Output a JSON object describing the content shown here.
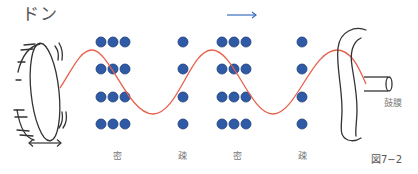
{
  "title_sound": "ドン",
  "labels": {
    "eardrum": "鼓膜",
    "caption": "図7−2",
    "regions": [
      {
        "text": "密",
        "x": 113
      },
      {
        "text": "疎",
        "x": 178
      },
      {
        "text": "密",
        "x": 233
      },
      {
        "text": "疎",
        "x": 298
      }
    ]
  },
  "colors": {
    "dot_fill": "#2f5aa6",
    "dot_stroke": "#1f3f7a",
    "wave": "#e8604c",
    "arrow": "#3a6fc4",
    "line": "#333333"
  },
  "particles": {
    "rows_y": [
      42,
      69,
      97,
      124
    ],
    "columns_x": [
      101,
      113,
      125,
      183,
      222,
      234,
      246,
      302
    ],
    "radius": 5
  },
  "direction_arrow": "propagation-direction-right",
  "vibration_arrow": "drum-vibration-left-right"
}
